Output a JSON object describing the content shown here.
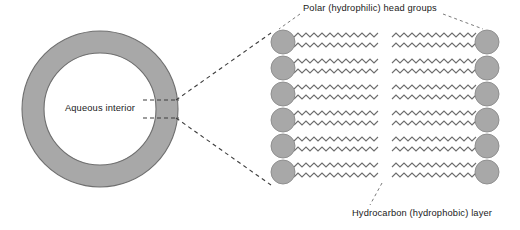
{
  "figure": {
    "labels": {
      "aqueous_interior": "Aqueous interior",
      "polar_head_groups": "Polar (hydrophilic) head groups",
      "hydrocarbon_layer": "Hydrocarbon (hydrophobic) layer"
    },
    "colors": {
      "fill_gray": "#a8a8a8",
      "stroke_gray": "#7d7d7d",
      "tail_stroke": "#6e6e6e",
      "dash_stroke": "#555555",
      "text": "#1a1a1a",
      "background": "#ffffff"
    },
    "vesicle": {
      "name": "vesicle-ring",
      "center_x": 100,
      "center_y": 109,
      "outer_radius": 78,
      "inner_radius": 56,
      "membrane_thickness": 22
    },
    "bilayer": {
      "name": "lipid-bilayer-detail",
      "rows": 6,
      "leaflets": 2,
      "heads_per_leaflet": 6,
      "head_radius": 12,
      "row_spacing": 26,
      "first_row_center_y": 42,
      "left_head_center_x": 283,
      "right_head_center_x": 487,
      "tails_per_head": 2,
      "zigzag_cycles": 10,
      "left_tail_start_x": 294,
      "left_tail_end_x": 378,
      "right_tail_start_x": 476,
      "right_tail_end_x": 392
    },
    "connectors": {
      "membrane_tick_top_y": 100,
      "membrane_tick_bottom_y": 118,
      "fan_top": "from vesicle wall to bilayer top-left",
      "fan_bottom": "from vesicle wall to bilayer bottom-left"
    }
  }
}
